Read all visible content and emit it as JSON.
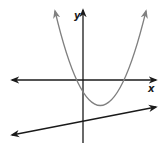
{
  "diagram": {
    "type": "coordinate-plane",
    "axes": {
      "x_label": "x",
      "y_label": "y",
      "axis_color": "#1a1a1a"
    },
    "curves": [
      {
        "kind": "parabola",
        "opens": "up",
        "color": "#808080",
        "vertex_quadrant": "IV",
        "x_intercepts": "one negative, one positive",
        "y_intercept": "negative"
      },
      {
        "kind": "line",
        "slope": "positive",
        "color": "#1a1a1a",
        "y_intercept": "negative"
      }
    ]
  }
}
